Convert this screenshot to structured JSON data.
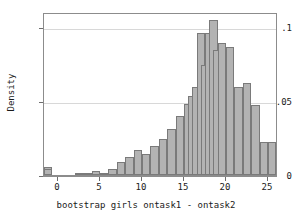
{
  "chart_data": {
    "type": "bar",
    "title": "",
    "subtitle": "",
    "xlabel": "bootstrap girls ontask1 - ontask2",
    "ylabel": "Density",
    "xlim": [
      1.5,
      27.5
    ],
    "ylim": [
      0,
      0.118
    ],
    "grid": "horizontal",
    "legend": "none",
    "bin_width": 1,
    "x_ticks": [
      0,
      5,
      10,
      15,
      20,
      25
    ],
    "x_tick_labels": [
      "0",
      "5",
      "10",
      "15",
      "20",
      "25"
    ],
    "y_ticks": [
      0,
      0.05,
      0.1
    ],
    "y_tick_labels": [
      "0",
      ".05",
      ".1"
    ],
    "bar_fill_color": "#b3b3b3",
    "bar_edge_color": "#7a7a7a",
    "frame_color": "#8c8c8c",
    "gridline_color": "#d8d8d8",
    "bins": [
      {
        "left": 2.0,
        "right": 3.0,
        "center": 2.5,
        "density": 0.0013
      },
      {
        "left": 3.0,
        "right": 4.0,
        "center": 3.5,
        "density": 0.0016
      },
      {
        "left": 4.0,
        "right": 5.0,
        "center": 4.5,
        "density": 0.0028
      },
      {
        "left": 5.0,
        "right": 6.0,
        "center": 5.5,
        "density": 0.0013
      },
      {
        "left": 6.0,
        "right": 7.0,
        "center": 6.5,
        "density": 0.004
      },
      {
        "left": 7.0,
        "right": 8.0,
        "center": 7.5,
        "density": 0.0092
      },
      {
        "left": 8.0,
        "right": 9.0,
        "center": 8.5,
        "density": 0.0128
      },
      {
        "left": 9.0,
        "right": 10.0,
        "center": 9.5,
        "density": 0.0178
      },
      {
        "left": 10.0,
        "right": 11.0,
        "center": 10.5,
        "density": 0.0152
      },
      {
        "left": 11.0,
        "right": 12.0,
        "center": 11.5,
        "density": 0.021
      },
      {
        "left": 12.0,
        "right": 13.0,
        "center": 12.5,
        "density": 0.0262
      },
      {
        "left": 13.0,
        "right": 14.0,
        "center": 13.5,
        "density": 0.033
      },
      {
        "left": 14.0,
        "right": 15.0,
        "center": 14.5,
        "density": 0.0428
      },
      {
        "left": 15.0,
        "right": 16.0,
        "center": 15.5,
        "density": 0.0516
      },
      {
        "left": 16.0,
        "right": 17.0,
        "center": 16.5,
        "density": 0.057
      },
      {
        "left": 17.0,
        "right": 18.0,
        "center": 17.5,
        "density": 0.0635
      },
      {
        "left": 18.0,
        "right": 19.0,
        "center": 18.5,
        "density": 0.103
      },
      {
        "left": 19.0,
        "right": 20.0,
        "center": 19.5,
        "density": 0.08
      },
      {
        "left": 20.0,
        "right": 21.0,
        "center": 20.5,
        "density": 0.103
      },
      {
        "left": 21.0,
        "right": 22.0,
        "center": 21.5,
        "density": 0.112
      },
      {
        "left": 22.0,
        "right": 23.0,
        "center": 22.5,
        "density": 0.0905
      },
      {
        "left": 23.0,
        "right": 24.0,
        "center": 23.5,
        "density": 0.0955
      },
      {
        "left": 24.0,
        "right": 25.0,
        "center": 24.5,
        "density": 0.093
      },
      {
        "left": 25.0,
        "right": 26.0,
        "center": 25.5,
        "density": 0.064
      },
      {
        "left": 26.0,
        "right": 27.0,
        "center": 26.5,
        "density": 0.0665
      },
      {
        "left": 27.0,
        "right": 28.0,
        "center": 27.5,
        "density": 0.051
      },
      {
        "left": 28.0,
        "right": 29.0,
        "center": 28.5,
        "density": 0.0238
      },
      {
        "left": 29.0,
        "right": 30.0,
        "center": 29.5,
        "density": 0.0238
      },
      {
        "left": 30.0,
        "right": 31.0,
        "center": 30.5,
        "density": 0.012
      },
      {
        "left": 31.0,
        "right": 32.0,
        "center": 31.5,
        "density": 0.0058
      },
      {
        "left": 32.0,
        "right": 33.0,
        "center": 32.5,
        "density": 0.004
      }
    ],
    "x_bin_starts": [
      2,
      3,
      4,
      5,
      6,
      7,
      8,
      9,
      10,
      11,
      12,
      13,
      14,
      15,
      15.5,
      16,
      16.5,
      17,
      17.5,
      18,
      18.5,
      19,
      20,
      21,
      22,
      23,
      24,
      25,
      26
    ],
    "values": [
      0.0013,
      0.0016,
      0.0028,
      0.0013,
      0.004,
      0.0092,
      0.0128,
      0.0178,
      0.0152,
      0.021,
      0.0262,
      0.033,
      0.0428,
      0.0516,
      0.057,
      0.0635,
      0.103,
      0.08,
      0.103,
      0.112,
      0.0905,
      0.0955,
      0.093,
      0.064,
      0.0665,
      0.051,
      0.0238,
      0.0238,
      0.012,
      0.0058,
      0.004
    ]
  },
  "axes": {
    "y_title": "Density",
    "x_title": "bootstrap girls ontask1 - ontask2",
    "y_labels": [
      "0",
      ".05",
      ".1"
    ],
    "x_labels": [
      "0",
      "5",
      "10",
      "15",
      "20",
      "25"
    ]
  }
}
